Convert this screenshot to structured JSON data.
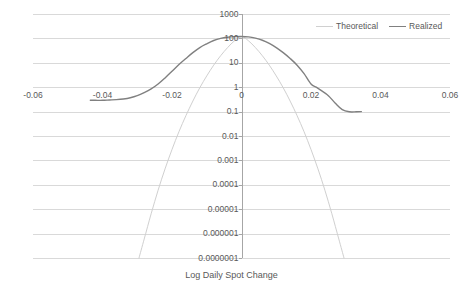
{
  "chart_data": {
    "type": "line",
    "title": "",
    "xlabel": "Log Daily Spot Change",
    "ylabel": "Frequency / Year (log scale)",
    "xlim": [
      -0.06,
      0.06
    ],
    "ylim": [
      1e-07,
      1000
    ],
    "yscale": "log",
    "grid": true,
    "legend_position": "top-right",
    "xticks": [
      "-0.06",
      "-0.04",
      "-0.02",
      "0",
      "0.02",
      "0.04",
      "0.06"
    ],
    "xtick_values": [
      -0.06,
      -0.04,
      -0.02,
      0,
      0.02,
      0.04,
      0.06
    ],
    "yticks": [
      "1000",
      "100",
      "10",
      "1",
      "0.1",
      "0.01",
      "0.001",
      "0.0001",
      "0.00001",
      "0.000001",
      "0.0000001"
    ],
    "ytick_values": [
      1000,
      100,
      10,
      1,
      0.1,
      0.01,
      0.001,
      0.0001,
      1e-05,
      1e-06,
      1e-07
    ],
    "series": [
      {
        "name": "Theoretical",
        "color": "#d0d0d0",
        "x": [
          -0.0295,
          -0.028,
          -0.026,
          -0.024,
          -0.022,
          -0.02,
          -0.018,
          -0.016,
          -0.014,
          -0.012,
          -0.01,
          -0.008,
          -0.006,
          -0.004,
          -0.002,
          0.0,
          0.002,
          0.004,
          0.006,
          0.008,
          0.01,
          0.012,
          0.014,
          0.016,
          0.018,
          0.02,
          0.022,
          0.024,
          0.026,
          0.028,
          0.0295
        ],
        "y": [
          1e-07,
          6e-07,
          6.5e-06,
          6e-05,
          0.00045,
          0.0028,
          0.015,
          0.068,
          0.27,
          0.95,
          2.9,
          8.0,
          19.5,
          42.0,
          80.0,
          118.0,
          80.0,
          42.0,
          19.5,
          8.0,
          2.9,
          0.95,
          0.27,
          0.068,
          0.015,
          0.0028,
          0.00045,
          6e-05,
          6.5e-06,
          6e-07,
          1e-07
        ]
      },
      {
        "name": "Realized",
        "color": "#808080",
        "x": [
          -0.0435,
          -0.042,
          -0.04,
          -0.038,
          -0.036,
          -0.034,
          -0.032,
          -0.03,
          -0.028,
          -0.026,
          -0.024,
          -0.022,
          -0.02,
          -0.018,
          -0.016,
          -0.014,
          -0.012,
          -0.01,
          -0.008,
          -0.006,
          -0.004,
          -0.002,
          0.0,
          0.002,
          0.004,
          0.006,
          0.008,
          0.01,
          0.012,
          0.014,
          0.016,
          0.018,
          0.02,
          0.0215,
          0.023,
          0.025,
          0.027,
          0.029,
          0.031,
          0.033,
          0.0345
        ],
        "y": [
          0.29,
          0.29,
          0.29,
          0.3,
          0.31,
          0.33,
          0.37,
          0.45,
          0.6,
          0.85,
          1.35,
          2.4,
          4.5,
          8.5,
          15.0,
          26.0,
          42.0,
          60.0,
          82.0,
          100.0,
          112.0,
          118.0,
          120.0,
          115.0,
          102.0,
          84.0,
          62.0,
          42.0,
          26.0,
          15.0,
          8.0,
          3.6,
          1.35,
          1.0,
          0.72,
          0.45,
          0.22,
          0.12,
          0.098,
          0.098,
          0.1
        ]
      }
    ]
  },
  "axis_titles": {
    "x": "Log Daily Spot Change",
    "y": "Frequency / Year (log scale)"
  },
  "legend": {
    "items": [
      {
        "label": "Theoretical",
        "color": "#d0d0d0"
      },
      {
        "label": "Realized",
        "color": "#808080"
      }
    ]
  },
  "colors": {
    "gridline": "#d9d9d9",
    "axis": "#a6a6a6",
    "text": "#595959",
    "background": "#ffffff"
  }
}
